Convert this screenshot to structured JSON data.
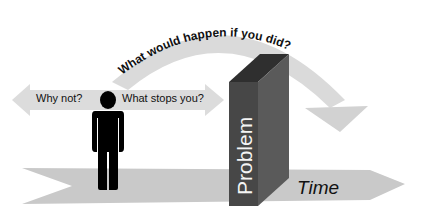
{
  "diagram": {
    "arc_question": "What would happen if you did?",
    "left_arrow_label": "Why not?",
    "right_arrow_label": "What stops you?",
    "obstacle_label": "Problem",
    "timeline_label": "Time",
    "colors": {
      "arrow_fill": "#c8c8c8",
      "arc_fill": "#d6d6d6",
      "box_front": "#4a4a4a",
      "box_top": "#2e2e2e",
      "box_side": "#5c5c5c",
      "figure": "#000000",
      "background": "#ffffff"
    }
  }
}
